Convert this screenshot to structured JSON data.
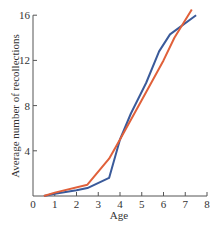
{
  "chart_data": {
    "type": "line",
    "title": "",
    "xlabel": "Age",
    "ylabel": "Average number of recollections",
    "xlim": [
      0,
      8
    ],
    "ylim": [
      0,
      16
    ],
    "x_ticks": [
      "0",
      "1",
      "2",
      "3",
      "4",
      "5",
      "6",
      "7",
      "8"
    ],
    "y_ticks": [
      "4",
      "8",
      "12",
      "16"
    ],
    "grid": false,
    "legend": null,
    "series": [
      {
        "name": "Blue line",
        "color": "#3a5a9a",
        "points": [
          [
            0.5,
            0
          ],
          [
            1,
            0.2
          ],
          [
            2,
            0.5
          ],
          [
            2.5,
            0.7
          ],
          [
            3.5,
            1.6
          ],
          [
            4,
            5
          ],
          [
            4.5,
            7.3
          ],
          [
            5.2,
            10
          ],
          [
            5.8,
            12.8
          ],
          [
            6.3,
            14.3
          ],
          [
            7.5,
            16
          ]
        ]
      },
      {
        "name": "Orange line",
        "color": "#e0603a",
        "points": [
          [
            0.5,
            0
          ],
          [
            1,
            0.3
          ],
          [
            2.5,
            1.0
          ],
          [
            3.5,
            3.3
          ],
          [
            4,
            5
          ],
          [
            5,
            8.5
          ],
          [
            6,
            12
          ],
          [
            6.5,
            14
          ],
          [
            7.3,
            16.5
          ]
        ]
      }
    ]
  },
  "axes": {
    "xlabel": "Age",
    "ylabel": "Average number of recollections",
    "zero_label": "0"
  }
}
